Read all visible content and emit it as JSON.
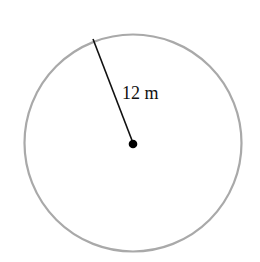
{
  "diagram": {
    "type": "circle",
    "radius_label": "12 m",
    "circle_stroke_color": "#a9a9a9",
    "radius_line_color": "#111111",
    "center_dot_color": "#000000"
  }
}
